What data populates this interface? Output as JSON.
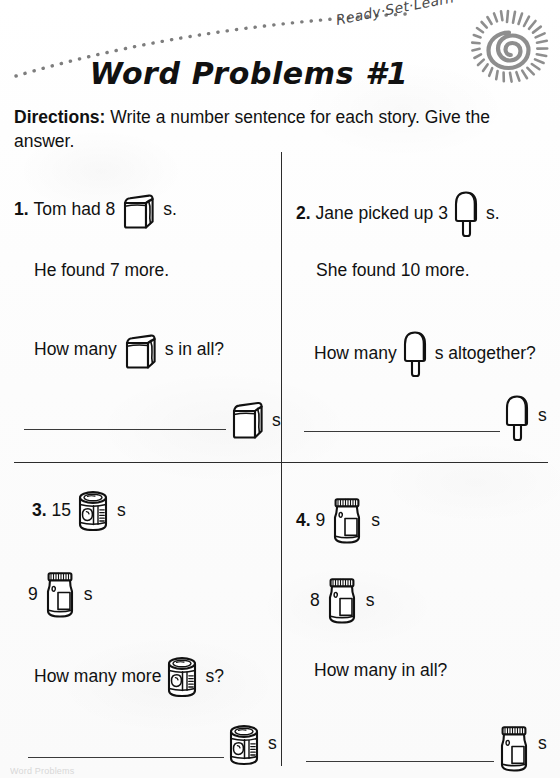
{
  "worksheet": {
    "brand": "Ready·Set·Learn",
    "title": "Word Problems #1",
    "directions_label": "Directions:",
    "directions_text": "Write a number sentence for each story.  Give the answer.",
    "footer_scrap": "Word Problems"
  },
  "icons": {
    "sun": "sun-spiral-logo-icon",
    "arc": "dotted-arc-icon",
    "bag": "paper-bag-icon",
    "popsicle": "popsicle-icon",
    "can": "tin-can-icon",
    "jar": "glass-jar-icon"
  },
  "problems": [
    {
      "number": "1.",
      "icon": "bag",
      "line1_before": "Tom had 8",
      "line1_after": "s.",
      "line2": "He found 7 more.",
      "line3_before": "How many",
      "line3_after": "s in all?",
      "answer_suffix": "s",
      "answer_value": ""
    },
    {
      "number": "2.",
      "icon": "popsicle",
      "line1_before": "Jane picked up 3",
      "line1_after": "s.",
      "line2": "She found 10 more.",
      "line3_before": "How many",
      "line3_after": "s altogether?",
      "answer_suffix": "s",
      "answer_value": ""
    },
    {
      "number": "3.",
      "icon": "can",
      "icon2": "jar",
      "line1_before": "15",
      "line1_after": "s",
      "line2_before": "9",
      "line2_after": "s",
      "line3_before": "How many more",
      "line3_after": "s?",
      "answer_suffix": "s",
      "answer_value": ""
    },
    {
      "number": "4.",
      "icon": "jar",
      "icon2": "jar",
      "line1_before": "9",
      "line1_after": "s",
      "line2_before": "8",
      "line2_after": "s",
      "line3_before": "How many in all?",
      "line3_after": "",
      "answer_suffix": "s",
      "answer_value": ""
    }
  ]
}
